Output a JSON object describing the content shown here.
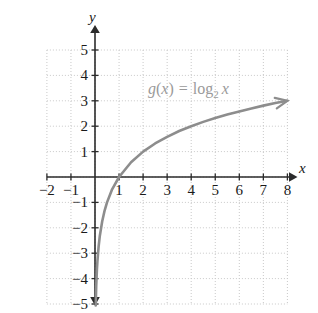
{
  "chart_data": {
    "type": "line",
    "title": "",
    "subtitle": "",
    "xlabel": "x",
    "ylabel": "y",
    "xlim": [
      -2,
      8
    ],
    "ylim": [
      -5,
      5
    ],
    "grid": true,
    "legend_position": "none",
    "annotations": [
      {
        "name": "function-equation",
        "parts": {
          "fn": "g",
          "open": "(",
          "var1": "x",
          "close": ")",
          "equals": "=",
          "log": "log",
          "base": "2",
          "var2": "x"
        },
        "plain": "g(x) = log2 x",
        "color": "#9a9a9a",
        "at_x": 4.1,
        "at_y": 3.6
      }
    ],
    "series": [
      {
        "name": "g(x) = log2 x",
        "color": "#8d8d8d",
        "arrow_end": true,
        "x": [
          0.03,
          0.05,
          0.08,
          0.1,
          0.15,
          0.2,
          0.3,
          0.4,
          0.5,
          0.7,
          1.0,
          1.5,
          2.0,
          2.5,
          3.0,
          3.5,
          4.0,
          4.5,
          5.0,
          5.5,
          6.0,
          6.5,
          7.0,
          7.5,
          8.0
        ],
        "y": [
          -5.06,
          -4.32,
          -3.64,
          -3.32,
          -2.74,
          -2.32,
          -1.74,
          -1.32,
          -1.0,
          -0.51,
          0.0,
          0.58,
          1.0,
          1.32,
          1.58,
          1.81,
          2.0,
          2.17,
          2.32,
          2.46,
          2.58,
          2.7,
          2.81,
          2.91,
          3.0
        ]
      }
    ],
    "x_ticks": [
      {
        "value": -2,
        "label": "−2"
      },
      {
        "value": -1,
        "label": "−1"
      },
      {
        "value": 1,
        "label": "1"
      },
      {
        "value": 2,
        "label": "2"
      },
      {
        "value": 3,
        "label": "3"
      },
      {
        "value": 4,
        "label": "4"
      },
      {
        "value": 5,
        "label": "5"
      },
      {
        "value": 6,
        "label": "6"
      },
      {
        "value": 7,
        "label": "7"
      },
      {
        "value": 8,
        "label": "8"
      }
    ],
    "y_ticks": [
      {
        "value": 5,
        "label": "5"
      },
      {
        "value": 4,
        "label": "4"
      },
      {
        "value": 3,
        "label": "3"
      },
      {
        "value": 2,
        "label": "2"
      },
      {
        "value": 1,
        "label": "1"
      },
      {
        "value": -1,
        "label": "−1"
      },
      {
        "value": -2,
        "label": "−2"
      },
      {
        "value": -3,
        "label": "−3"
      },
      {
        "value": -4,
        "label": "−4"
      },
      {
        "value": -5,
        "label": "−5"
      }
    ],
    "colors": {
      "grid": "#c9c9c9",
      "axis": "#2b2b2b",
      "curve": "#8d8d8d",
      "label": "#1a1a1a",
      "annotation": "#9a9a9a",
      "background": "#ffffff"
    }
  }
}
